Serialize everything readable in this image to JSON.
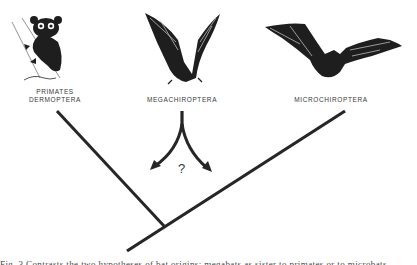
{
  "figure": {
    "taxa": [
      {
        "id": "primates",
        "label_line1": "PRIMATES",
        "label_line2": "DERMOPTERA",
        "illustration": "tarsier"
      },
      {
        "id": "mega",
        "label_line1": "MEGACHIROPTERA",
        "illustration": "fruit-bat"
      },
      {
        "id": "micro",
        "label_line1": "MICROCHIROPTERA",
        "illustration": "microbat"
      }
    ],
    "uncertainty_mark": "?",
    "caption": "Fig. 3  Contrasts the two hypotheses of bat origins: megabats as sister to primates or to microbats",
    "ink_color": "#262626"
  }
}
